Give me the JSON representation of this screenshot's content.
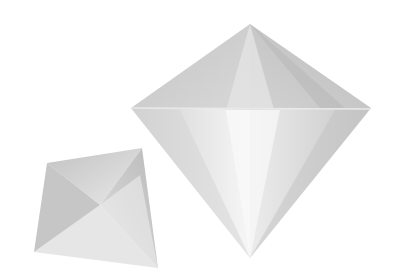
{
  "scene": {
    "description": "Two white faceted octahedron (diamond) shapes on a white background",
    "background": "#ffffff",
    "objects": [
      {
        "name": "large-octahedron",
        "color_light": "#f4f4f4",
        "color_mid": "#d6d6d6",
        "color_dark": "#b8b8b8"
      },
      {
        "name": "small-octahedron",
        "color_light": "#ececec",
        "color_mid": "#cfcfcf",
        "color_dark": "#b0b0b0"
      }
    ]
  }
}
